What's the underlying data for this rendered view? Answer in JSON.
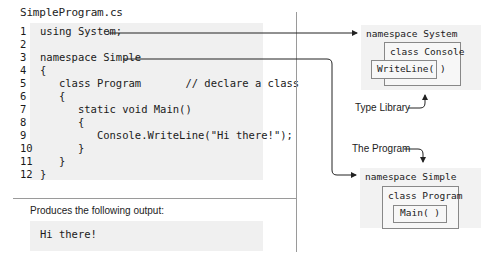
{
  "code_panel": {
    "filename": "SimpleProgram.cs",
    "lines": [
      {
        "num": "1",
        "text": "using System;"
      },
      {
        "num": "2",
        "text": ""
      },
      {
        "num": "3",
        "text": "namespace Simple"
      },
      {
        "num": "4",
        "text": "{"
      },
      {
        "num": "5",
        "text": "   class Program       // declare a class"
      },
      {
        "num": "6",
        "text": "   {"
      },
      {
        "num": "7",
        "text": "      static void Main()"
      },
      {
        "num": "8",
        "text": "      {"
      },
      {
        "num": "9",
        "text": "         Console.WriteLine(\"Hi there!\");"
      },
      {
        "num": "10",
        "text": "      }"
      },
      {
        "num": "11",
        "text": "   }"
      },
      {
        "num": "12",
        "text": "}"
      }
    ]
  },
  "output_panel": {
    "label": "Produces the following output:",
    "text": "Hi there!"
  },
  "diagram": {
    "type_library": {
      "namespace_label": "namespace System",
      "class_label": "class Console",
      "method_label": "WriteLine( )",
      "annotation": "Type Library"
    },
    "program": {
      "namespace_label": "namespace Simple",
      "class_label": "class Program",
      "method_label": "Main( )",
      "annotation": "The Program"
    }
  },
  "colors": {
    "code_background": "#f0f0f0",
    "line_color": "#222222",
    "divider": "#9a9a9a"
  }
}
